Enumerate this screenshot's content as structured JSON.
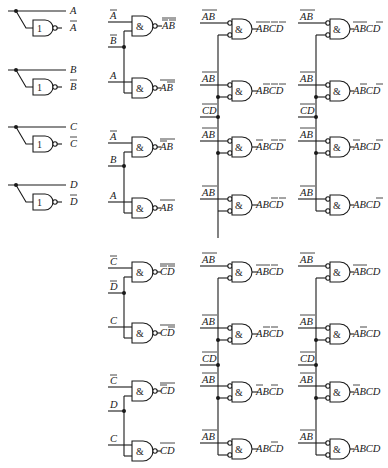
{
  "diagram": {
    "type": "4-to-16 line decoder logic diagram",
    "colors": {
      "ink": "#1a1a1a",
      "background": "#ffffff"
    },
    "inverters": [
      {
        "input": "A",
        "outputs": [
          "A",
          "A̅"
        ],
        "symbol": "1",
        "label_true": "A",
        "label_inv": "A",
        "inv_bar": true
      },
      {
        "input": "B",
        "label_true": "B",
        "label_inv": "B",
        "symbol": "1"
      },
      {
        "input": "C",
        "label_true": "C",
        "label_inv": "C",
        "symbol": "1"
      },
      {
        "input": "D",
        "label_true": "D",
        "label_inv": "D",
        "symbol": "1"
      }
    ],
    "stage1_gates": {
      "symbol": "&",
      "ab_group_1": [
        {
          "in_label": "A",
          "in_bar": true,
          "out_label": "AB",
          "note": "inputs Ā, B̄ → output ¬(ĀB̄)"
        },
        {
          "in_label": "A",
          "in_bar": false,
          "out_label": "AB",
          "note": "inputs A, B̄ → output ¬(AB̄)"
        }
      ],
      "ab_group_1_shared": {
        "label": "B",
        "bar": true
      },
      "ab_group_2": [
        {
          "in_label": "A",
          "in_bar": true,
          "out_label": "AB",
          "note": "inputs Ā, B → output ¬(ĀB)"
        },
        {
          "in_label": "A",
          "in_bar": false,
          "out_label": "AB",
          "note": "inputs A, B → output ¬(AB)"
        }
      ],
      "ab_group_2_shared": {
        "label": "B",
        "bar": false
      },
      "cd_group_1": [
        {
          "in_label": "C",
          "in_bar": true,
          "out_label": "CD",
          "note": "inputs C̄, D̄ → ¬(C̄D̄)"
        },
        {
          "in_label": "C",
          "in_bar": false,
          "out_label": "CD",
          "note": "inputs C, D̄ → ¬(CD̄)"
        }
      ],
      "cd_group_1_shared": {
        "label": "D",
        "bar": true
      },
      "cd_group_2": [
        {
          "in_label": "C",
          "in_bar": true,
          "out_label": "CD",
          "note": "inputs C̄, D → ¬(C̄D)"
        },
        {
          "in_label": "C",
          "in_bar": false,
          "out_label": "CD",
          "note": "inputs C, D → ¬(CD)"
        }
      ],
      "cd_group_2_shared": {
        "label": "D",
        "bar": false
      }
    },
    "stage2_gates": {
      "symbol": "&",
      "input_label": "AB",
      "bus_label": "CD",
      "column_3_top": [
        "ĀB̄C̄D̄",
        "ĀB̄C̄D̄ (AB̄)",
        "ĀBC̄D̄",
        "ABC̄D̄"
      ],
      "outputs": {
        "col3_top": [
          "A̅B̅C̅D̅",
          "AB̅C̅D̅",
          "A̅BC̅D̅",
          "ABC̅D̅"
        ],
        "col4_top": [
          "A̅B̅CD̅",
          "AB̅CD̅",
          "A̅BCD̅",
          "ABCD̅"
        ],
        "col3_bottom": [
          "A̅B̅C̅D",
          "AB̅C̅D",
          "A̅BC̅D",
          "ABC̅D"
        ],
        "col4_bottom": [
          "A̅B̅CD",
          "AB̅CD",
          "A̅BCD",
          "ABCD"
        ]
      }
    },
    "text": {
      "A": "A",
      "B": "B",
      "C": "C",
      "D": "D",
      "one": "1",
      "amp": "&",
      "AB": "AB",
      "CD": "CD",
      "out_c3t_0": "ABCD",
      "out_c3t_1": "ABCD",
      "out_c3t_2": "ABCD",
      "out_c3t_3": "ABCD",
      "out_c4t_0": "ABCD",
      "out_c4t_1": "ABCD",
      "out_c4t_2": "ABCD",
      "out_c4t_3": "ABCD",
      "out_c3b_0": "ABCD",
      "out_c3b_1": "ABCD",
      "out_c3b_2": "ABCD",
      "out_c3b_3": "ABCD",
      "out_c4b_0": "ABCD",
      "out_c4b_1": "ABCD",
      "out_c4b_2": "ABCD",
      "out_c4b_3": "ABCD"
    }
  }
}
